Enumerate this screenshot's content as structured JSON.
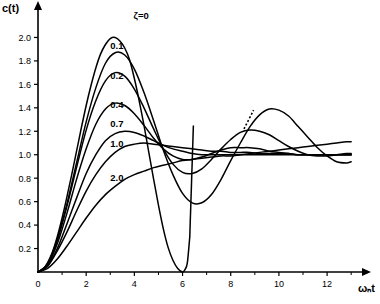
{
  "chart_data": {
    "type": "line",
    "title": "",
    "subtitle": "",
    "xlabel": "ωₙt",
    "ylabel": "c(t)",
    "xlim": [
      0,
      13.2
    ],
    "ylim": [
      0,
      2.2
    ],
    "grid": false,
    "legend_position": "inline-annotations",
    "xticks": [
      0,
      2,
      4,
      6,
      8,
      10,
      12
    ],
    "xticklabels": [
      "0",
      "2",
      "4",
      "6",
      "8",
      "10",
      "12"
    ],
    "yticks": [
      0.2,
      0.4,
      0.6,
      0.8,
      1.0,
      1.2,
      1.4,
      1.6,
      1.8,
      2.0
    ],
    "yticklabels": [
      "0.2",
      "0.4",
      "0.6",
      "0.8",
      "1.0",
      "1.2",
      "1.4",
      "1.6",
      "1.8",
      "2.0"
    ],
    "annotations": [
      {
        "text": "ζ=0",
        "x": 4.6,
        "y": 2.18
      },
      {
        "text": "0.1",
        "x": 3.55,
        "y": 1.93
      },
      {
        "text": "0.2",
        "x": 3.55,
        "y": 1.67
      },
      {
        "text": "0.4",
        "x": 3.55,
        "y": 1.42
      },
      {
        "text": "0.7",
        "x": 3.55,
        "y": 1.26
      },
      {
        "text": "1.0",
        "x": 3.55,
        "y": 1.09
      },
      {
        "text": "2.0",
        "x": 3.55,
        "y": 0.8
      }
    ],
    "pointer_line": {
      "x_start": 8.55,
      "y_start": 1.22,
      "x_end": 8.95,
      "y_end": 1.38,
      "style": "dotted"
    },
    "series": [
      {
        "name": "ζ=0",
        "zeta": 0.0,
        "x": [
          0,
          0.2,
          0.4,
          0.6,
          0.8,
          1.0,
          1.2,
          1.4,
          1.6,
          1.8,
          2.0,
          2.2,
          2.4,
          2.6,
          2.8,
          3.0,
          3.2,
          3.4,
          3.6,
          3.8,
          4.0,
          4.2,
          4.4,
          4.6,
          4.8,
          5.0,
          5.2,
          5.4,
          5.6,
          5.8,
          6.0,
          6.1,
          6.2,
          6.3
        ],
        "y": [
          0,
          0.02,
          0.08,
          0.17,
          0.3,
          0.46,
          0.64,
          0.83,
          1.03,
          1.23,
          1.42,
          1.59,
          1.74,
          1.86,
          1.94,
          1.99,
          2.0,
          1.97,
          1.91,
          1.81,
          1.65,
          1.46,
          1.25,
          1.02,
          0.79,
          0.57,
          0.37,
          0.21,
          0.1,
          0.03,
          0.0,
          0.02,
          0.08,
          0.3
        ]
      },
      {
        "name": "0.1",
        "zeta": 0.1,
        "x": [
          0,
          0.4,
          0.8,
          1.2,
          1.6,
          2.0,
          2.4,
          2.8,
          3.2,
          3.6,
          4.0,
          4.4,
          4.8,
          5.2,
          5.6,
          6.0,
          6.4,
          6.8,
          7.2,
          7.6,
          8.0,
          8.4,
          8.8,
          9.2,
          9.6,
          10.0,
          10.4,
          10.8,
          11.2,
          11.6,
          12.0,
          12.4,
          12.8,
          13.0
        ],
        "y": [
          0,
          0.07,
          0.28,
          0.58,
          0.93,
          1.28,
          1.57,
          1.78,
          1.87,
          1.85,
          1.73,
          1.53,
          1.29,
          1.04,
          0.83,
          0.67,
          0.59,
          0.59,
          0.66,
          0.79,
          0.95,
          1.1,
          1.24,
          1.34,
          1.39,
          1.38,
          1.33,
          1.24,
          1.15,
          1.06,
          0.99,
          0.94,
          0.93,
          0.94
        ]
      },
      {
        "name": "0.2",
        "zeta": 0.2,
        "x": [
          0,
          0.4,
          0.8,
          1.2,
          1.6,
          2.0,
          2.4,
          2.8,
          3.2,
          3.6,
          4.0,
          4.4,
          4.8,
          5.2,
          5.6,
          6.0,
          6.4,
          6.8,
          7.2,
          7.6,
          8.0,
          8.4,
          8.8,
          9.2,
          9.6,
          10.0,
          10.4,
          10.8,
          11.2,
          11.6,
          12.0,
          12.4,
          12.8,
          13.0
        ],
        "y": [
          0,
          0.07,
          0.27,
          0.56,
          0.89,
          1.21,
          1.46,
          1.63,
          1.7,
          1.67,
          1.56,
          1.4,
          1.22,
          1.05,
          0.92,
          0.85,
          0.84,
          0.88,
          0.96,
          1.05,
          1.13,
          1.19,
          1.21,
          1.2,
          1.17,
          1.12,
          1.07,
          1.03,
          1.0,
          0.99,
          0.99,
          1.0,
          1.01,
          1.01
        ]
      },
      {
        "name": "0.4",
        "zeta": 0.4,
        "x": [
          0,
          0.4,
          0.8,
          1.2,
          1.6,
          2.0,
          2.4,
          2.8,
          3.2,
          3.6,
          4.0,
          4.4,
          4.8,
          5.2,
          5.6,
          6.0,
          6.4,
          6.8,
          7.2,
          7.6,
          8.0,
          8.4,
          8.8,
          9.2,
          9.6,
          10.0,
          10.4,
          10.8,
          11.2,
          11.6,
          12.0,
          12.4,
          12.8,
          13.0
        ],
        "y": [
          0,
          0.06,
          0.24,
          0.5,
          0.79,
          1.05,
          1.26,
          1.39,
          1.44,
          1.42,
          1.35,
          1.25,
          1.14,
          1.05,
          0.99,
          0.96,
          0.96,
          0.98,
          1.01,
          1.04,
          1.06,
          1.06,
          1.06,
          1.05,
          1.03,
          1.02,
          1.01,
          1.0,
          1.0,
          1.0,
          1.0,
          1.0,
          1.0,
          1.0
        ]
      },
      {
        "name": "0.7",
        "zeta": 0.7,
        "x": [
          0,
          0.4,
          0.8,
          1.2,
          1.6,
          2.0,
          2.4,
          2.8,
          3.2,
          3.6,
          4.0,
          4.4,
          4.8,
          5.2,
          5.6,
          6.0,
          6.4,
          6.8,
          7.2,
          7.6,
          8.0,
          8.4,
          8.8,
          9.2,
          9.6,
          10.0,
          10.4,
          10.8,
          11.2,
          11.6,
          12.0,
          12.4,
          12.8,
          13.0
        ],
        "y": [
          0,
          0.05,
          0.2,
          0.41,
          0.63,
          0.84,
          1.0,
          1.12,
          1.18,
          1.2,
          1.19,
          1.16,
          1.12,
          1.08,
          1.05,
          1.03,
          1.01,
          1.0,
          1.0,
          1.0,
          1.0,
          1.0,
          1.0,
          1.0,
          1.0,
          1.0,
          1.0,
          1.0,
          1.0,
          1.0,
          1.0,
          1.0,
          1.0,
          1.0
        ]
      },
      {
        "name": "1.0",
        "zeta": 1.0,
        "x": [
          0,
          0.4,
          0.8,
          1.2,
          1.6,
          2.0,
          2.4,
          2.8,
          3.2,
          3.6,
          4.0,
          4.4,
          4.8,
          5.2,
          5.6,
          6.0,
          6.4,
          6.8,
          7.2,
          7.6,
          8.0,
          8.4,
          8.8,
          9.2,
          9.6,
          10.0,
          10.4,
          10.8,
          11.2,
          11.6,
          12.0,
          12.4,
          12.8,
          13.0
        ],
        "y": [
          0,
          0.05,
          0.18,
          0.34,
          0.52,
          0.69,
          0.83,
          0.94,
          1.02,
          1.07,
          1.09,
          1.1,
          1.09,
          1.08,
          1.07,
          1.06,
          1.05,
          1.04,
          1.03,
          1.03,
          1.02,
          1.02,
          1.02,
          1.01,
          1.01,
          1.01,
          1.01,
          1.0,
          1.0,
          1.0,
          1.0,
          1.0,
          1.0,
          1.0
        ]
      },
      {
        "name": "2.0",
        "zeta": 2.0,
        "x": [
          0,
          0.4,
          0.8,
          1.2,
          1.6,
          2.0,
          2.4,
          2.8,
          3.2,
          3.6,
          4.0,
          4.4,
          4.8,
          5.2,
          5.6,
          6.0,
          6.4,
          6.8,
          7.2,
          7.6,
          8.0,
          8.4,
          8.8,
          9.2,
          9.6,
          10.0,
          10.4,
          10.8,
          11.2,
          11.6,
          12.0,
          12.4,
          12.8,
          13.0
        ],
        "y": [
          0,
          0.03,
          0.11,
          0.22,
          0.34,
          0.46,
          0.57,
          0.66,
          0.73,
          0.79,
          0.83,
          0.86,
          0.89,
          0.91,
          0.93,
          0.95,
          0.96,
          0.97,
          0.98,
          0.99,
          0.99,
          1.0,
          1.01,
          1.02,
          1.03,
          1.04,
          1.05,
          1.06,
          1.07,
          1.08,
          1.09,
          1.1,
          1.11,
          1.11
        ]
      }
    ]
  }
}
